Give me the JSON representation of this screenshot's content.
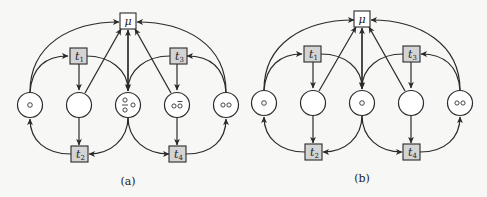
{
  "figure": {
    "panels": [
      {
        "id": "a",
        "caption": "(a)",
        "mu_label": "μ",
        "transitions": [
          "t1",
          "t2",
          "t3",
          "t4"
        ],
        "transition_labels": {
          "t1": {
            "base": "t",
            "sub": "1"
          },
          "t2": {
            "base": "t",
            "sub": "2"
          },
          "t3": {
            "base": "t",
            "sub": "3"
          },
          "t4": {
            "base": "t",
            "sub": "4"
          }
        },
        "places": [
          {
            "index": 1,
            "tokens": "○"
          },
          {
            "index": 2,
            "tokens": ""
          },
          {
            "index": 3,
            "tokens": "○ ○̄ ○ (stacked)"
          },
          {
            "index": 4,
            "tokens": "○○̄"
          },
          {
            "index": 5,
            "tokens": "○○"
          }
        ]
      },
      {
        "id": "b",
        "caption": "(b)",
        "mu_label": "μ",
        "transitions": [
          "t1",
          "t2",
          "t3",
          "t4"
        ],
        "transition_labels": {
          "t1": {
            "base": "t",
            "sub": "1"
          },
          "t2": {
            "base": "t",
            "sub": "2"
          },
          "t3": {
            "base": "t",
            "sub": "3"
          },
          "t4": {
            "base": "t",
            "sub": "4"
          }
        },
        "places": [
          {
            "index": 1,
            "tokens": "○"
          },
          {
            "index": 2,
            "tokens": ""
          },
          {
            "index": 3,
            "tokens": "○"
          },
          {
            "index": 4,
            "tokens": ""
          },
          {
            "index": 5,
            "tokens": "○○"
          }
        ]
      }
    ]
  }
}
